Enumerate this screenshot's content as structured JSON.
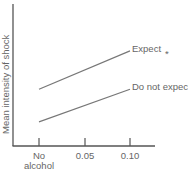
{
  "chart_data": {
    "type": "line",
    "title": "",
    "xlabel": "",
    "ylabel": "Mean intensity of shock",
    "categories": [
      "No\nalcohol",
      "0.05",
      "0.10"
    ],
    "x_tick_labels": [
      [
        "No",
        "alcohol"
      ],
      [
        "0.05"
      ],
      [
        "0.10"
      ]
    ],
    "y_ticks": [],
    "grid": false,
    "legend": "inline-right",
    "series": [
      {
        "name": "Expect",
        "values": [
          0.4,
          null,
          0.67
        ],
        "endpoints_only": true
      },
      {
        "name": "Do not expect",
        "values": [
          0.17,
          null,
          0.4
        ],
        "endpoints_only": true
      }
    ],
    "annotations": [
      {
        "text": "*",
        "near": "Expect"
      }
    ],
    "ylim": [
      0,
      1
    ]
  }
}
